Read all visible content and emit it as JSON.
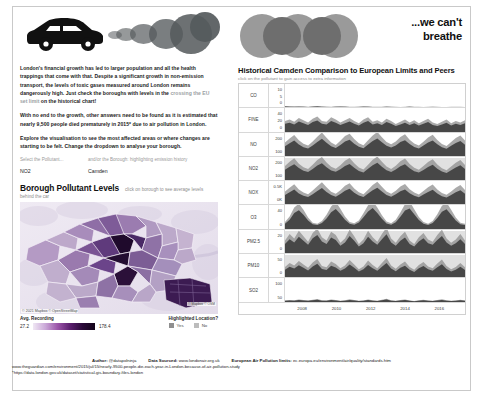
{
  "intro": {
    "paragraph1_a": "London's financial growth has led to larger population and all the health trappings that come with that. Despite a significant growth in non-emission transport, the levels of toxic gases measured around London remains dangerously high. Just check the boroughs with levels in the ",
    "paragraph1_highlight": "crossing the EU set limit",
    "paragraph1_b": " on the historical chart!",
    "paragraph2_a": "With no end to the growth, other answers need to be found as it is estimated that ",
    "paragraph2_bold": "nearly 9,500 people died prematurely in 2015*",
    "paragraph2_b": " due to air pollution in London.",
    "paragraph3": "Explore the visualisation to see the most affected areas or where changes are starting to be felt. Change the dropdown to analyse your borough."
  },
  "selectors": {
    "pollutant_label": "Select the Pollutant...",
    "pollutant_value": "NO2",
    "borough_label": "and/or the Borough: highlighting emission history",
    "borough_value": "Camden"
  },
  "borough_section": {
    "title": "Borough Pollutant Levels",
    "subtitle": "click on borough to see average levels",
    "subtitle2": "behind the car"
  },
  "map": {
    "credit_left": "© 2021 Mapbox © OpenStreetMap",
    "credit_right": "© Mapbox © OSM",
    "legend_title": "Avg. Recording",
    "legend_min": "27.2",
    "legend_max": "178.4",
    "highlight_title": "Highlighted Location?",
    "highlight_yes": "Yes",
    "highlight_no": "No"
  },
  "breathe": {
    "line1": "...we can't",
    "line2": "breathe"
  },
  "chart_data": {
    "type": "area",
    "title": "Historical Camden Comparison to European Limits and Peers",
    "subtitle": "click on the pollutant to gain access to extra information",
    "xlabel": "",
    "ylabel": "",
    "grid": false,
    "legend": "none",
    "x_ticks": [
      "2008",
      "2010",
      "2012",
      "2014",
      "2016"
    ],
    "xlim": [
      2007,
      2017.5
    ],
    "series": [
      {
        "name": "CO",
        "y_ticks": [
          "10",
          "5",
          "0"
        ],
        "ylim": [
          0,
          10
        ],
        "limit_band": null,
        "values": [
          0.55,
          0.5,
          0.45,
          0.5,
          0.42,
          0.38,
          0.5,
          0.55,
          0.45,
          0.4,
          0.35,
          0.45,
          0.5,
          0.42,
          0.38,
          0.35,
          0.4,
          0.48,
          0.42,
          0.36,
          0.32,
          0.38,
          0.45,
          0.4,
          0.35,
          0.3,
          0.34,
          0.42,
          0.38,
          0.33,
          0.3,
          0.36,
          0.4,
          0.35,
          0.3,
          0.28,
          0.32,
          0.38,
          0.34,
          0.3
        ]
      },
      {
        "name": "FINE",
        "y_ticks": [
          "40",
          "20",
          "0"
        ],
        "ylim": [
          0,
          40
        ],
        "limit_band": null,
        "values": [
          14,
          16,
          13,
          18,
          15,
          12,
          17,
          20,
          14,
          13,
          19,
          16,
          12,
          15,
          18,
          14,
          11,
          16,
          19,
          13,
          15,
          12,
          17,
          14,
          10,
          13,
          16,
          12,
          15,
          11,
          14,
          17,
          12,
          10,
          13,
          16,
          11,
          14,
          12,
          15
        ]
      },
      {
        "name": "NO",
        "y_ticks": [
          "200",
          "100"
        ],
        "ylim": [
          0,
          260
        ],
        "limit_band": null,
        "values": [
          120,
          155,
          185,
          140,
          110,
          95,
          130,
          170,
          205,
          160,
          120,
          100,
          135,
          175,
          195,
          150,
          115,
          98,
          140,
          180,
          210,
          165,
          125,
          105,
          130,
          168,
          190,
          145,
          112,
          96,
          128,
          162,
          186,
          142,
          108,
          92,
          125,
          158,
          180,
          138
        ]
      },
      {
        "name": "NO2",
        "y_ticks": [
          "200",
          "100"
        ],
        "ylim": [
          0,
          260
        ],
        "limit_band": [
          40,
          260
        ],
        "values": [
          125,
          160,
          190,
          145,
          115,
          100,
          135,
          175,
          200,
          155,
          118,
          102,
          132,
          170,
          192,
          148,
          112,
          96,
          136,
          178,
          205,
          160,
          120,
          100,
          128,
          165,
          188,
          142,
          110,
          94,
          124,
          158,
          182,
          138,
          106,
          90,
          120,
          152,
          176,
          134
        ]
      },
      {
        "name": "NOX",
        "y_ticks": [
          "0.5K",
          "0K"
        ],
        "ylim": [
          0,
          600
        ],
        "limit_band": null,
        "values": [
          260,
          330,
          400,
          300,
          240,
          205,
          280,
          360,
          440,
          340,
          255,
          215,
          285,
          370,
          420,
          320,
          245,
          208,
          295,
          385,
          450,
          350,
          260,
          215,
          275,
          355,
          405,
          305,
          238,
          200,
          268,
          340,
          395,
          296,
          228,
          195,
          260,
          330,
          385,
          290
        ]
      },
      {
        "name": "O3",
        "y_ticks": [
          "40",
          "0"
        ],
        "ylim": [
          0,
          55
        ],
        "limit_band": null,
        "values": [
          12,
          22,
          38,
          45,
          34,
          20,
          11,
          9,
          14,
          25,
          40,
          48,
          36,
          22,
          12,
          10,
          15,
          28,
          42,
          50,
          38,
          24,
          13,
          10,
          16,
          29,
          44,
          49,
          35,
          21,
          12,
          9,
          14,
          26,
          41,
          47,
          34,
          20,
          11,
          9
        ]
      },
      {
        "name": "PM2.5",
        "y_ticks": [
          "20",
          "0"
        ],
        "ylim": [
          0,
          28
        ],
        "limit_band": [
          0,
          28
        ],
        "values": [
          12,
          18,
          14,
          21,
          16,
          11,
          19,
          23,
          15,
          12,
          20,
          17,
          10,
          14,
          22,
          16,
          9,
          13,
          21,
          15,
          11,
          18,
          24,
          14,
          10,
          16,
          20,
          12,
          9,
          15,
          19,
          13,
          11,
          17,
          22,
          14,
          10,
          13,
          18,
          12
        ]
      },
      {
        "name": "PM10",
        "y_ticks": [
          "50",
          "0"
        ],
        "ylim": [
          0,
          62
        ],
        "limit_band": [
          0,
          62
        ],
        "values": [
          22,
          30,
          25,
          34,
          27,
          20,
          31,
          38,
          24,
          21,
          33,
          28,
          19,
          25,
          36,
          27,
          17,
          23,
          35,
          26,
          19,
          30,
          40,
          25,
          18,
          27,
          33,
          22,
          16,
          26,
          32,
          23,
          19,
          29,
          37,
          24,
          17,
          22,
          30,
          21
        ]
      },
      {
        "name": "SO2",
        "y_ticks": [
          "100",
          "50"
        ],
        "ylim": [
          0,
          120
        ],
        "limit_band": null,
        "values": [
          5,
          7,
          6,
          9,
          7,
          5,
          8,
          11,
          6,
          5,
          9,
          7,
          4,
          6,
          10,
          7,
          4,
          5,
          9,
          6,
          4,
          8,
          12,
          6,
          4,
          7,
          9,
          5,
          3,
          6,
          8,
          5,
          4,
          7,
          10,
          6,
          4,
          5,
          8,
          5
        ]
      }
    ]
  },
  "footer": {
    "author_label": "Author:",
    "author_value": "@datapolninja",
    "source_label": "Data Sourced:",
    "source_value": "www.londonair.org.uk",
    "limits_label": "European Air Pollution limits:",
    "limits_value": "ec.europa.eu/environment/air/quality/standards.htm",
    "line2": "www.theguardian.com/environment/2015/jul/15/nearly-9500-people-die-each-year-in-London-because-of-air-pollution-study",
    "line3": "*https://data.london.gov.uk/dataset/statistical-gis-boundary-files-london"
  },
  "colors": {
    "accent_dark": "#2a0a38",
    "accent_mid": "#9a54a8",
    "chart_fill": "#6b6b6b",
    "limit_band": "#c9c9c9"
  }
}
